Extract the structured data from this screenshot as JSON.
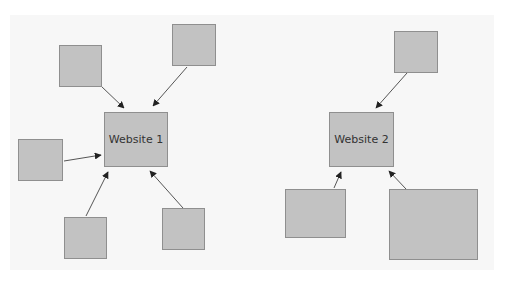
{
  "diagram": {
    "type": "hub-and-spoke",
    "colors": {
      "node_fill": "#c2c2c2",
      "node_border": "#8f8f8f",
      "edge": "#555555",
      "background": "#f7f7f7"
    },
    "hubs": [
      {
        "id": "website1",
        "label": "Website 1",
        "x": 104,
        "y": 112,
        "w": 64,
        "h": 55
      },
      {
        "id": "website2",
        "label": "Website 2",
        "x": 329,
        "y": 112,
        "w": 65,
        "h": 55
      }
    ],
    "spokes": [
      {
        "id": "w1-top-left",
        "label": "",
        "target": "website1",
        "x": 59,
        "y": 45,
        "w": 43,
        "h": 42
      },
      {
        "id": "w1-top-right",
        "label": "",
        "target": "website1",
        "x": 172,
        "y": 24,
        "w": 44,
        "h": 42
      },
      {
        "id": "w1-left",
        "label": "",
        "target": "website1",
        "x": 18,
        "y": 139,
        "w": 45,
        "h": 42
      },
      {
        "id": "w1-bottom-left",
        "label": "",
        "target": "website1",
        "x": 64,
        "y": 217,
        "w": 43,
        "h": 42
      },
      {
        "id": "w1-bottom-right",
        "label": "",
        "target": "website1",
        "x": 162,
        "y": 208,
        "w": 43,
        "h": 42
      },
      {
        "id": "w2-top",
        "label": "",
        "target": "website2",
        "x": 394,
        "y": 31,
        "w": 44,
        "h": 42
      },
      {
        "id": "w2-bottom-left",
        "label": "",
        "target": "website2",
        "x": 285,
        "y": 189,
        "w": 61,
        "h": 49
      },
      {
        "id": "w2-bottom-right",
        "label": "",
        "target": "website2",
        "x": 389,
        "y": 189,
        "w": 89,
        "h": 71
      }
    ],
    "edges": [
      {
        "from": "w1-top-left",
        "to": "website1",
        "x1": 101,
        "y1": 86,
        "x2": 124,
        "y2": 108
      },
      {
        "from": "w1-top-right",
        "to": "website1",
        "x1": 187,
        "y1": 67,
        "x2": 153,
        "y2": 106
      },
      {
        "from": "w1-left",
        "to": "website1",
        "x1": 64,
        "y1": 161,
        "x2": 101,
        "y2": 155
      },
      {
        "from": "w1-bottom-left",
        "to": "website1",
        "x1": 86,
        "y1": 216,
        "x2": 108,
        "y2": 172
      },
      {
        "from": "w1-bottom-right",
        "to": "website1",
        "x1": 183,
        "y1": 208,
        "x2": 150,
        "y2": 171
      },
      {
        "from": "w2-top",
        "to": "website2",
        "x1": 407,
        "y1": 73,
        "x2": 376,
        "y2": 108
      },
      {
        "from": "w2-bottom-left",
        "to": "website2",
        "x1": 334,
        "y1": 188,
        "x2": 341,
        "y2": 172
      },
      {
        "from": "w2-bottom-right",
        "to": "website2",
        "x1": 406,
        "y1": 189,
        "x2": 389,
        "y2": 171
      }
    ]
  }
}
